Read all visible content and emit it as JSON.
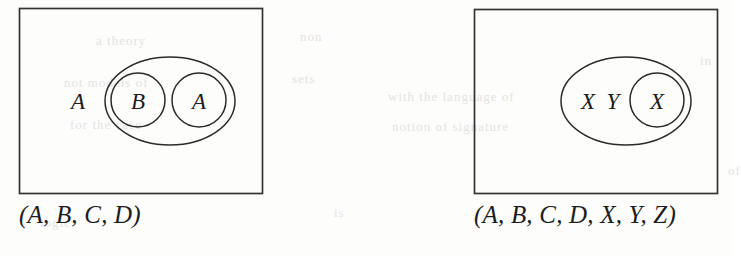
{
  "document": {
    "kind": "scanned-figure-pair",
    "background_color": "#fdfdfc",
    "ink_color": "#1d1d1d"
  },
  "figures": [
    {
      "id": "left-figure",
      "name": "venn-diagram-left",
      "rect": {
        "x": 19,
        "y": 8,
        "width": 243,
        "height": 185
      },
      "outer_ellipse": {
        "cx": 170,
        "cy": 101,
        "rx": 65,
        "ry": 44
      },
      "free_label": {
        "text": "A",
        "x": 78,
        "y": 101
      },
      "inner_circles": [
        {
          "label": "B",
          "cx": 138,
          "cy": 100,
          "r": 27
        },
        {
          "label": "A",
          "cx": 199,
          "cy": 100,
          "r": 27
        }
      ],
      "caption": {
        "open_paren": "(",
        "items": [
          "A",
          "B",
          "C",
          "D"
        ],
        "separator": ",",
        "close_paren": ")",
        "full_text": "(A, B, C, D)"
      }
    },
    {
      "id": "right-figure",
      "name": "venn-diagram-right",
      "rect": {
        "x": 474,
        "y": 9,
        "width": 243,
        "height": 184
      },
      "outer_ellipse": {
        "cx": 626,
        "cy": 101,
        "rx": 65,
        "ry": 44
      },
      "free_labels": [
        {
          "text": "X",
          "x": 588,
          "y": 101
        },
        {
          "text": "Y",
          "x": 613,
          "y": 101
        }
      ],
      "inner_circles": [
        {
          "label": "X",
          "cx": 657,
          "cy": 100,
          "r": 27
        }
      ],
      "caption": {
        "open_paren": "(",
        "items": [
          "A",
          "B",
          "C",
          "D",
          "X",
          "Y",
          "Z"
        ],
        "separator": ",",
        "close_paren": ")",
        "full_text": "(A, B, C, D, X, Y, Z)"
      }
    }
  ],
  "captions": {
    "left": "(A, B, C, D)",
    "right": "(A, B, C, D, X, Y, Z)"
  },
  "labels": {
    "left_outside": "A",
    "left_circle_1": "B",
    "left_circle_2": "A",
    "right_outside_1": "X",
    "right_outside_2": "Y",
    "right_circle_1": "X"
  },
  "ghost_text": {
    "lines": [
      {
        "text": "a theory",
        "x": 96,
        "y": 40
      },
      {
        "text": "non",
        "x": 300,
        "y": 36
      },
      {
        "text": "not  models  of",
        "x": 64,
        "y": 82
      },
      {
        "text": "sets",
        "x": 292,
        "y": 78
      },
      {
        "text": "for the  case",
        "x": 70,
        "y": 124
      },
      {
        "text": "with  the  language  of",
        "x": 388,
        "y": 96
      },
      {
        "text": "notion  of  signature",
        "x": 392,
        "y": 126
      },
      {
        "text": "in",
        "x": 700,
        "y": 60
      },
      {
        "text": "logic",
        "x": 40,
        "y": 222
      },
      {
        "text": "is",
        "x": 334,
        "y": 212
      },
      {
        "text": "of",
        "x": 728,
        "y": 170
      }
    ]
  }
}
